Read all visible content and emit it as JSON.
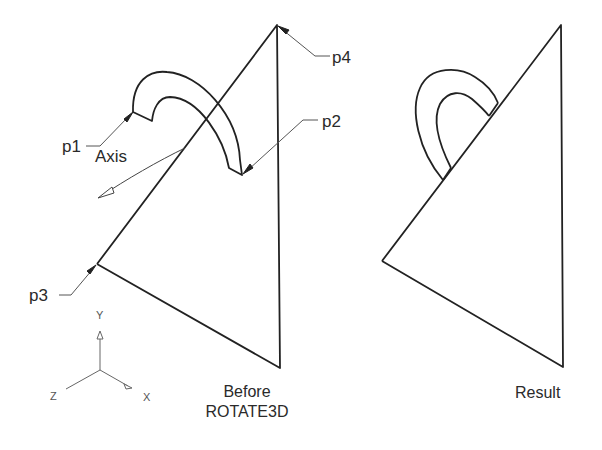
{
  "diagram": {
    "type": "cad-illustration",
    "before": {
      "caption_line1": "Before",
      "caption_line2": "ROTATE3D",
      "points": {
        "p1": "p1",
        "p2": "p2",
        "p3": "p3",
        "p4": "p4"
      },
      "axis_label": "Axis"
    },
    "result": {
      "caption": "Result"
    },
    "ucs_icon": {
      "x": "X",
      "y": "Y",
      "z": "Z"
    },
    "colors": {
      "line": "#222222",
      "leader": "#555555",
      "background": "#ffffff"
    }
  }
}
